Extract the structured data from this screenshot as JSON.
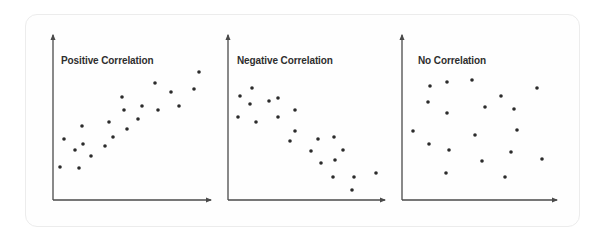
{
  "chart_data": [
    {
      "type": "scatter",
      "title": "Positive Correlation",
      "xlabel": "",
      "ylabel": "",
      "grid": false,
      "axes": {
        "x0": 53,
        "y0": 200,
        "x_end": 211,
        "y_end": 35
      },
      "points": [
        [
          60,
          167
        ],
        [
          64,
          139
        ],
        [
          75,
          150
        ],
        [
          79,
          168
        ],
        [
          82,
          126
        ],
        [
          83,
          144
        ],
        [
          91,
          156
        ],
        [
          105,
          146
        ],
        [
          109,
          122
        ],
        [
          113,
          137
        ],
        [
          122,
          97
        ],
        [
          124,
          110
        ],
        [
          127,
          129
        ],
        [
          138,
          119
        ],
        [
          142,
          106
        ],
        [
          155,
          83
        ],
        [
          158,
          110
        ],
        [
          171,
          92
        ],
        [
          179,
          106
        ],
        [
          194,
          89
        ],
        [
          199,
          72
        ]
      ]
    },
    {
      "type": "scatter",
      "title": "Negative Correlation",
      "xlabel": "",
      "ylabel": "",
      "grid": false,
      "axes": {
        "x0": 228,
        "y0": 200,
        "x_end": 385,
        "y_end": 35
      },
      "points": [
        [
          240,
          96
        ],
        [
          252,
          88
        ],
        [
          250,
          104
        ],
        [
          238,
          117
        ],
        [
          256,
          122
        ],
        [
          269,
          101
        ],
        [
          278,
          98
        ],
        [
          278,
          117
        ],
        [
          295,
          110
        ],
        [
          295,
          131
        ],
        [
          290,
          141
        ],
        [
          318,
          139
        ],
        [
          334,
          137
        ],
        [
          311,
          151
        ],
        [
          343,
          150
        ],
        [
          321,
          163
        ],
        [
          335,
          160
        ],
        [
          333,
          177
        ],
        [
          354,
          177
        ],
        [
          376,
          173
        ],
        [
          352,
          190
        ]
      ]
    },
    {
      "type": "scatter",
      "title": "No Correlation",
      "xlabel": "",
      "ylabel": "",
      "grid": false,
      "axes": {
        "x0": 402,
        "y0": 200,
        "x_end": 557,
        "y_end": 35
      },
      "points": [
        [
          430,
          86
        ],
        [
          447,
          82
        ],
        [
          472,
          80
        ],
        [
          428,
          102
        ],
        [
          447,
          113
        ],
        [
          413,
          131
        ],
        [
          429,
          144
        ],
        [
          449,
          150
        ],
        [
          446,
          173
        ],
        [
          485,
          107
        ],
        [
          475,
          135
        ],
        [
          482,
          161
        ],
        [
          501,
          96
        ],
        [
          514,
          109
        ],
        [
          517,
          130
        ],
        [
          511,
          152
        ],
        [
          505,
          177
        ],
        [
          537,
          88
        ],
        [
          542,
          159
        ]
      ]
    }
  ],
  "panels": [
    {
      "title": "Positive Correlation"
    },
    {
      "title": "Negative Correlation"
    },
    {
      "title": "No Correlation"
    }
  ],
  "colors": {
    "axis": "#4a4a4a",
    "dot": "#2b2b2b",
    "title": "#2e2e2e",
    "card_border": "#ececec"
  }
}
